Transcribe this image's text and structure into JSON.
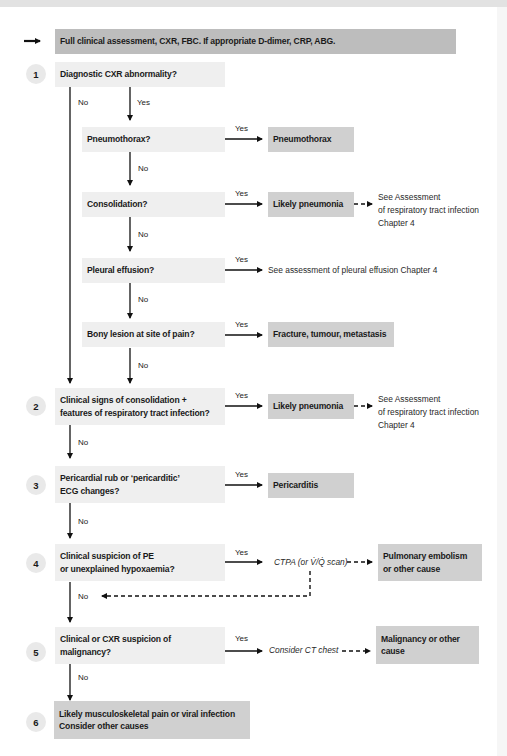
{
  "header": {
    "text": "Full clinical assessment, CXR, FBC. If appropriate D-dimer, CRP, ABG."
  },
  "labels": {
    "yes": "Yes",
    "no": "No"
  },
  "steps": [
    {
      "number": "1",
      "question": "Diagnostic CXR abnormality?",
      "sub_questions": [
        {
          "question": "Pneumothorax?",
          "result": "Pneumothorax"
        },
        {
          "question": "Consolidation?",
          "result": "Likely pneumonia",
          "note": [
            "See Assessment",
            "of respiratory tract infection",
            "Chapter 4"
          ]
        },
        {
          "question": "Pleural effusion?",
          "note_inline": "See assessment of pleural effusion Chapter 4"
        },
        {
          "question": "Bony lesion at site of pain?",
          "result": "Fracture, tumour, metastasis"
        }
      ]
    },
    {
      "number": "2",
      "question": [
        "Clinical signs of consolidation +",
        "features of respiratory tract infection?"
      ],
      "result": "Likely pneumonia",
      "note": [
        "See Assessment",
        "of respiratory tract infection",
        "Chapter 4"
      ]
    },
    {
      "number": "3",
      "question": [
        "Pericardial rub or ‘pericarditic’",
        "ECG changes?"
      ],
      "result": "Pericarditis"
    },
    {
      "number": "4",
      "question": [
        "Clinical suspicion of PE",
        "or unexplained hypoxaemia?"
      ],
      "intermediate": "CTPA (or V̇/Q̇ scan)",
      "result": [
        "Pulmonary embolism",
        "or other cause"
      ]
    },
    {
      "number": "5",
      "question": [
        "Clinical or CXR suspicion of",
        "malignancy?"
      ],
      "intermediate": "Consider CT chest",
      "result": [
        "Malignancy or other",
        "cause"
      ]
    },
    {
      "number": "6",
      "result": [
        "Likely musculoskeletal pain or viral infection",
        "Consider other causes"
      ]
    }
  ],
  "colors": {
    "header_box": "#bdbdbd",
    "question_box": "#efefef",
    "result_box": "#d0d0d0",
    "number_circle": "#e9e9e9",
    "line": "#111111"
  }
}
